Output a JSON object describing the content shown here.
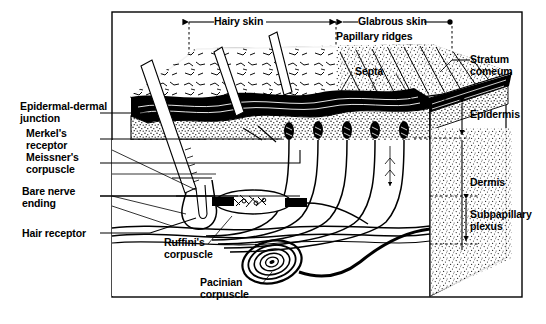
{
  "figure": {
    "title_visible": false,
    "type": "anatomical-cross-section",
    "style": "black-and-white line drawing"
  },
  "top_labels": {
    "hairy_skin": "Hairy skin",
    "glabrous_skin": "Glabrous skin",
    "papillary_ridges": "Papillary ridges",
    "septa": "Septa"
  },
  "left_labels": [
    {
      "id": "epidermal-dermal-junction",
      "line1": "Epidermal-dermal",
      "line2": "junction"
    },
    {
      "id": "merkels-receptor",
      "line1": "Merkel's",
      "line2": "receptor"
    },
    {
      "id": "meissners-corpuscle",
      "line1": "Meissner's",
      "line2": "corpuscle"
    },
    {
      "id": "bare-nerve-ending",
      "line1": "Bare nerve",
      "line2": "ending"
    },
    {
      "id": "hair-receptor",
      "line1": "Hair receptor",
      "line2": ""
    }
  ],
  "right_labels": [
    {
      "id": "stratum-corneum",
      "line1": "Stratum",
      "line2": "comeum"
    },
    {
      "id": "epidermis",
      "line1": "Epidermis",
      "line2": ""
    },
    {
      "id": "dermis",
      "line1": "Dermis",
      "line2": ""
    },
    {
      "id": "subpapillary-plexus",
      "line1": "Subpapillary",
      "line2": "plexus"
    }
  ],
  "inner_labels": [
    {
      "id": "ruffinis-corpuscle",
      "line1": "Ruffini's",
      "line2": "corpuscle"
    },
    {
      "id": "pacinian-corpuscle",
      "line1": "Pacinian",
      "line2": "corpuscle"
    }
  ],
  "colors": {
    "ink": "#000000",
    "paper": "#ffffff"
  }
}
